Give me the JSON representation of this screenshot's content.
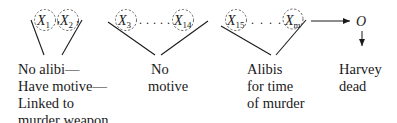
{
  "groups": [
    {
      "variables": [
        {
          "symbol": "X",
          "subscript": "1"
        },
        {
          "symbol": "X",
          "subscript": "2"
        }
      ],
      "label_lines": [
        "No alibi—",
        "Have motive—",
        "Linked to",
        "murder weapon"
      ]
    },
    {
      "variables": [
        {
          "symbol": "X",
          "subscript": "3"
        },
        {
          "symbol": "X",
          "subscript": "14"
        }
      ],
      "ellipsis": ". . . . .",
      "label_lines": [
        "No",
        "motive"
      ]
    },
    {
      "variables": [
        {
          "symbol": "X",
          "subscript": "15"
        },
        {
          "symbol": "X",
          "subscript": "m"
        }
      ],
      "ellipsis": ". . . .",
      "label_lines": [
        "Alibis",
        "for time",
        "of murder"
      ]
    }
  ],
  "outcome": {
    "symbol": "O",
    "label_lines": [
      "Harvey",
      "dead"
    ]
  },
  "colors": {
    "ink": "#1a1a1a",
    "circle_dash": "#555555"
  }
}
